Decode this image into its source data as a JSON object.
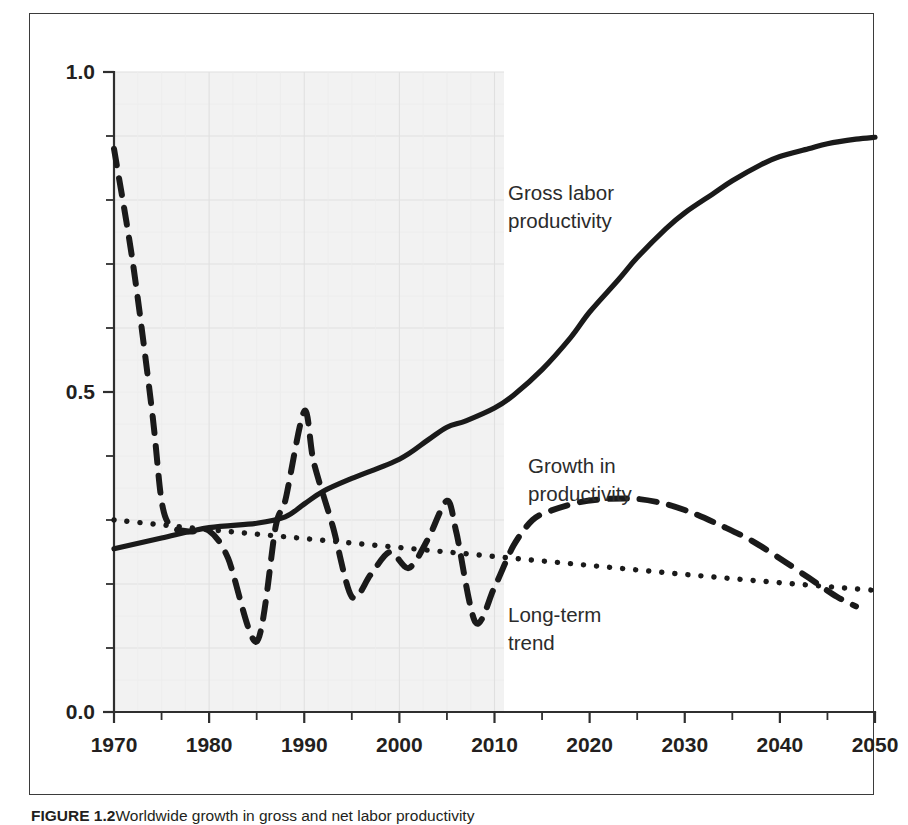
{
  "figure": {
    "caption_label": "FIGURE 1.2",
    "caption_text": "Worldwide growth in gross and net labor productivity"
  },
  "axes": {
    "y_tick_labels": [
      "1.0",
      "0.5",
      "0.0"
    ],
    "x_tick_labels": [
      "1970",
      "1980",
      "1990",
      "2000",
      "2010",
      "2020",
      "2030",
      "2040",
      "2050"
    ],
    "y_axis_title": "",
    "x_axis_title": ""
  },
  "annotations": {
    "gross": {
      "line1": "Gross labor",
      "line2": "productivity"
    },
    "growth": {
      "line1": "Growth in",
      "line2": "productivity"
    },
    "trend": {
      "line1": "Long-term",
      "line2": "trend"
    }
  },
  "colors": {
    "ink": "#231f20",
    "line": "#1a1a1a",
    "shading": "#f2f2f2",
    "gridline": "#e4e4e4",
    "frame": "#3b3b3b"
  },
  "chart_data": {
    "type": "line",
    "title": "",
    "xlabel": "",
    "ylabel": "",
    "xlim": [
      1970,
      2050
    ],
    "ylim": [
      0.0,
      1.0
    ],
    "y_major_ticks": [
      0.0,
      0.5,
      1.0
    ],
    "y_minor_ticks": [
      0.1,
      0.2,
      0.3,
      0.4,
      0.6,
      0.7,
      0.8,
      0.9
    ],
    "x_major_ticks": [
      1970,
      1980,
      1990,
      2000,
      2010,
      2020,
      2030,
      2040,
      2050
    ],
    "x_minor_ticks": [
      1975,
      1985,
      1995,
      2005,
      2015,
      2025,
      2035,
      2045
    ],
    "grid": true,
    "legend": "inline-annotations",
    "shaded_region": {
      "label": "historical",
      "x_from": 1970,
      "x_to": 2011,
      "color": "#f2f2f2"
    },
    "series": [
      {
        "name": "Gross labor productivity",
        "style": "solid",
        "x": [
          1970,
          1975,
          1980,
          1985,
          1988,
          1990,
          1992,
          1995,
          2000,
          2003,
          2005,
          2007,
          2010,
          2012,
          2015,
          2018,
          2020,
          2023,
          2025,
          2028,
          2030,
          2033,
          2035,
          2038,
          2040,
          2043,
          2045,
          2048,
          2050
        ],
        "y": [
          0.255,
          0.272,
          0.288,
          0.295,
          0.305,
          0.325,
          0.345,
          0.365,
          0.395,
          0.425,
          0.445,
          0.455,
          0.475,
          0.495,
          0.535,
          0.585,
          0.625,
          0.675,
          0.71,
          0.755,
          0.78,
          0.81,
          0.83,
          0.855,
          0.868,
          0.88,
          0.888,
          0.895,
          0.898
        ]
      },
      {
        "name": "Growth in productivity",
        "style": "dashed",
        "x": [
          1970,
          1972,
          1974,
          1975,
          1976,
          1978,
          1980,
          1982,
          1985,
          1987,
          1988,
          1990,
          1991,
          1993,
          1995,
          1997,
          1999,
          2001,
          2003,
          2005,
          2006,
          2008,
          2010,
          2012,
          2014,
          2016,
          2019,
          2022,
          2025,
          2028,
          2031,
          2034,
          2037,
          2040,
          2043,
          2046,
          2048
        ],
        "y": [
          0.88,
          0.7,
          0.47,
          0.33,
          0.29,
          0.282,
          0.283,
          0.24,
          0.11,
          0.29,
          0.33,
          0.47,
          0.39,
          0.29,
          0.18,
          0.215,
          0.25,
          0.225,
          0.27,
          0.33,
          0.28,
          0.14,
          0.195,
          0.26,
          0.3,
          0.315,
          0.328,
          0.333,
          0.333,
          0.325,
          0.31,
          0.29,
          0.268,
          0.24,
          0.21,
          0.18,
          0.165
        ]
      },
      {
        "name": "Long-term trend",
        "style": "dotted",
        "x": [
          1970,
          1980,
          1990,
          2000,
          2010,
          2020,
          2030,
          2040,
          2050
        ],
        "y": [
          0.3,
          0.285,
          0.271,
          0.257,
          0.243,
          0.229,
          0.215,
          0.202,
          0.19
        ]
      }
    ]
  }
}
